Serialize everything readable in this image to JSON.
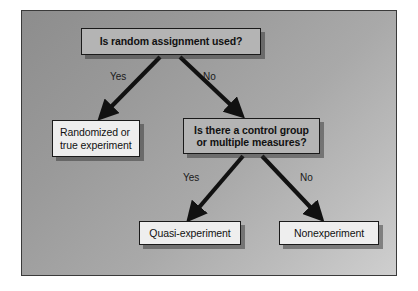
{
  "diagram": {
    "background": {
      "frame_border_color": "#3a3a3a",
      "gradient_from": "#8d8d8d",
      "gradient_to": "#cfcfcf"
    },
    "colors": {
      "decision_fill": "#b4b4b4",
      "outcome_fill": "#eeeeee",
      "border": "#1a1a1a",
      "arrow": "#111111",
      "text": "#111111",
      "shadow": "rgba(40,40,40,0.45)"
    },
    "nodes": [
      {
        "id": "root",
        "kind": "decision",
        "lines": [
          "Is random assignment used?"
        ]
      },
      {
        "id": "randomized",
        "kind": "outcome",
        "lines": [
          "Randomized or",
          "true experiment"
        ]
      },
      {
        "id": "control",
        "kind": "decision",
        "lines": [
          "Is there a control group",
          "or multiple measures?"
        ]
      },
      {
        "id": "quasi",
        "kind": "outcome",
        "lines": [
          "Quasi-experiment"
        ]
      },
      {
        "id": "nonexperiment",
        "kind": "outcome",
        "lines": [
          "Nonexperiment"
        ]
      }
    ],
    "edges": [
      {
        "id": "root-yes",
        "from": "root",
        "to": "randomized",
        "label": "Yes"
      },
      {
        "id": "root-no",
        "from": "root",
        "to": "control",
        "label": "No"
      },
      {
        "id": "control-yes",
        "from": "control",
        "to": "quasi",
        "label": "Yes"
      },
      {
        "id": "control-no",
        "from": "control",
        "to": "nonexperiment",
        "label": "No"
      }
    ]
  }
}
